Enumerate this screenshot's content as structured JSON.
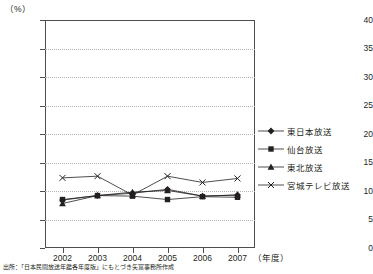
{
  "chart_data": {
    "type": "line",
    "title": "",
    "xlabel": "（年度）",
    "ylabel": "（%）",
    "unit_label": "（%）",
    "categories": [
      "2002",
      "2003",
      "2004",
      "2005",
      "2006",
      "2007"
    ],
    "ylim": [
      0,
      40
    ],
    "ytick_step": 5,
    "yticks": [
      "0",
      "5",
      "10",
      "15",
      "20",
      "25",
      "30",
      "35",
      "40"
    ],
    "grid": true,
    "legend_position": "right",
    "series": [
      {
        "name": "東日本放送",
        "marker": "diamond",
        "values": [
          8.4,
          9.2,
          9.6,
          10.3,
          9.1,
          9.3
        ]
      },
      {
        "name": "仙台放送",
        "marker": "square",
        "values": [
          8.5,
          9.2,
          9.1,
          8.5,
          9.0,
          8.9
        ]
      },
      {
        "name": "東北放送",
        "marker": "triangle",
        "values": [
          7.8,
          9.2,
          9.8,
          10.1,
          9.1,
          9.3
        ]
      },
      {
        "name": "宮城テレビ放送",
        "marker": "cross",
        "values": [
          12.3,
          12.6,
          9.3,
          12.6,
          11.5,
          12.2
        ]
      }
    ]
  },
  "legend": {
    "items": [
      {
        "label": "東日本放送",
        "marker": "diamond"
      },
      {
        "label": "仙台放送",
        "marker": "square"
      },
      {
        "label": "東北放送",
        "marker": "triangle"
      },
      {
        "label": "宮城テレビ放送",
        "marker": "cross"
      }
    ]
  },
  "source": {
    "note": "出所：「日本民間放送年鑑各年度版」にもとづき矢富事務所作成"
  },
  "colors": {
    "series": "#231f20",
    "axis": "#4d4d4d",
    "grid": "#b5b5b5",
    "background": "#ffffff"
  }
}
